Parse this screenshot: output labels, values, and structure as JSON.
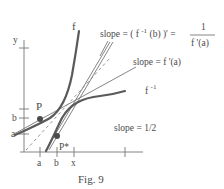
{
  "figure": {
    "caption": "Fig. 9",
    "axes": {
      "y_label": "y",
      "x_ticks": [
        "a",
        "b",
        "x"
      ],
      "y_ticks": [
        "a",
        "b"
      ]
    },
    "curves": {
      "f_label": "f",
      "f_inverse_label": "f",
      "f_inverse_sup": "-1"
    },
    "points": {
      "p_label": "P",
      "p_star_label": "P*"
    },
    "annotations": {
      "slope_inverse": {
        "prefix": "slope = ( f",
        "sup": "-1",
        "suffix": "(b) )' =",
        "numerator": "1",
        "denominator": "f '(a)"
      },
      "slope_f": "slope = f '(a)",
      "slope_half": "slope = 1/2"
    }
  }
}
